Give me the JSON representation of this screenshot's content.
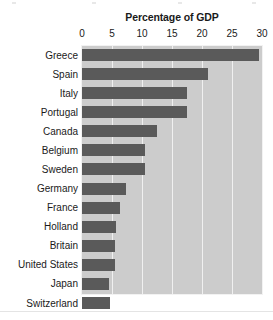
{
  "chart_data": {
    "type": "bar",
    "orientation": "horizontal",
    "title": "Percentage of GDP",
    "xlabel": "",
    "ylabel": "",
    "xlim": [
      0,
      30
    ],
    "grid": true,
    "legend": null,
    "axis_position": "top",
    "tick_labels": [
      "0",
      "5",
      "10",
      "15",
      "20",
      "25",
      "30"
    ],
    "ticks": [
      0,
      5,
      10,
      15,
      20,
      25,
      30
    ],
    "categories": [
      "Greece",
      "Spain",
      "Italy",
      "Portugal",
      "Canada",
      "Belgium",
      "Sweden",
      "Germany",
      "France",
      "Holland",
      "Britain",
      "United States",
      "Japan",
      "Switzerland"
    ],
    "values": [
      29.5,
      21.0,
      17.5,
      17.5,
      12.5,
      10.5,
      10.5,
      7.3,
      6.3,
      5.6,
      5.5,
      5.5,
      4.5,
      4.7
    ],
    "colors": {
      "bar": "#5a5a5a",
      "plot_background": "#cccccc",
      "gridline": "#f0f0f0",
      "text": "#1a1a1a",
      "page_background": "#ffffff"
    }
  }
}
